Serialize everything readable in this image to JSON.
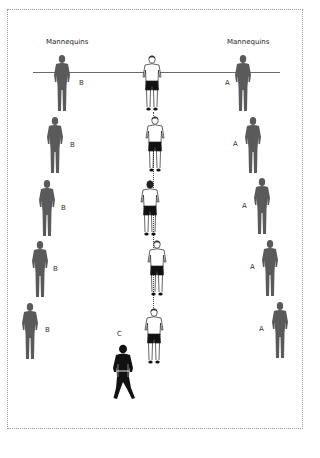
{
  "diagram": {
    "headings": {
      "left": "Mannequins",
      "right": "Mannequins"
    },
    "colors": {
      "mannequin": "#5a5a5a",
      "player_shorts": "#111111",
      "coach": "#111111",
      "line": "#6a6a6a",
      "frame": "#9a9a9a"
    },
    "left_column": {
      "label": "B",
      "items": [
        {
          "label": "B",
          "x": 62,
          "y": 55
        },
        {
          "label": "B",
          "x": 55,
          "y": 117
        },
        {
          "label": "B",
          "x": 47,
          "y": 180
        },
        {
          "label": "B",
          "x": 40,
          "y": 241
        },
        {
          "label": "B",
          "x": 30,
          "y": 303
        }
      ]
    },
    "right_column": {
      "label": "A",
      "items": [
        {
          "label": "A",
          "x": 243,
          "y": 55
        },
        {
          "label": "A",
          "x": 253,
          "y": 117
        },
        {
          "label": "A",
          "x": 262,
          "y": 178
        },
        {
          "label": "A",
          "x": 270,
          "y": 240
        },
        {
          "label": "A",
          "x": 280,
          "y": 302
        }
      ]
    },
    "center_players": [
      {
        "x": 152,
        "y": 55
      },
      {
        "x": 155,
        "y": 116
      },
      {
        "x": 150,
        "y": 180
      },
      {
        "x": 157,
        "y": 240
      },
      {
        "x": 154,
        "y": 308
      }
    ],
    "coach": {
      "label": "C",
      "x": 122,
      "y": 345
    },
    "start_line": {
      "y": 72,
      "x1": 33,
      "x2": 280
    }
  }
}
